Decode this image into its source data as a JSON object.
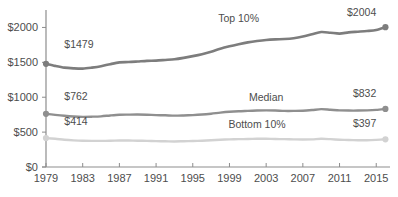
{
  "chart_data": {
    "type": "line",
    "title": "",
    "subtitle": "",
    "xlabel": "",
    "ylabel": "",
    "xlim": [
      1979,
      2016.5
    ],
    "ylim": [
      0,
      2250
    ],
    "grid": false,
    "legend_position": "inline-labels",
    "y_ticks": [
      {
        "value": 0,
        "label": "$0"
      },
      {
        "value": 500,
        "label": "$500"
      },
      {
        "value": 1000,
        "label": "$1000"
      },
      {
        "value": 1500,
        "label": "$1500"
      },
      {
        "value": 2000,
        "label": "$2000"
      }
    ],
    "x_ticks": [
      {
        "value": 1979,
        "label": "1979"
      },
      {
        "value": 1983,
        "label": "1983"
      },
      {
        "value": 1987,
        "label": "1987"
      },
      {
        "value": 1991,
        "label": "1991"
      },
      {
        "value": 1995,
        "label": "1995"
      },
      {
        "value": 1999,
        "label": "1999"
      },
      {
        "value": 2003,
        "label": "2003"
      },
      {
        "value": 2007,
        "label": "2007"
      },
      {
        "value": 2011,
        "label": "2011"
      },
      {
        "value": 2015,
        "label": "2015"
      }
    ],
    "series": [
      {
        "name": "Top 10%",
        "label": "Top 10%",
        "color": "#7d7d7d",
        "start_value_label": "$1479",
        "end_value_label": "$2004",
        "start_value": 1479,
        "end_value": 2004,
        "x": [
          1979,
          1980,
          1981,
          1982,
          1983,
          1984,
          1985,
          1986,
          1987,
          1988,
          1989,
          1990,
          1991,
          1992,
          1993,
          1994,
          1995,
          1996,
          1997,
          1998,
          1999,
          2000,
          2001,
          2002,
          2003,
          2004,
          2005,
          2006,
          2007,
          2008,
          2009,
          2010,
          2011,
          2012,
          2013,
          2014,
          2015,
          2016
        ],
        "values": [
          1479,
          1449,
          1424,
          1414,
          1410,
          1424,
          1444,
          1474,
          1499,
          1504,
          1512,
          1521,
          1524,
          1534,
          1544,
          1564,
          1589,
          1617,
          1652,
          1694,
          1729,
          1759,
          1786,
          1806,
          1821,
          1829,
          1834,
          1846,
          1869,
          1902,
          1934,
          1924,
          1912,
          1929,
          1939,
          1949,
          1964,
          2004
        ]
      },
      {
        "name": "Median",
        "label": "Median",
        "color": "#8f8f8f",
        "start_value_label": "$762",
        "end_value_label": "$832",
        "start_value": 762,
        "end_value": 832,
        "x": [
          1979,
          1980,
          1981,
          1982,
          1983,
          1984,
          1985,
          1986,
          1987,
          1988,
          1989,
          1990,
          1991,
          1992,
          1993,
          1994,
          1995,
          1996,
          1997,
          1998,
          1999,
          2000,
          2001,
          2002,
          2003,
          2004,
          2005,
          2006,
          2007,
          2008,
          2009,
          2010,
          2011,
          2012,
          2013,
          2014,
          2015,
          2016
        ],
        "values": [
          762,
          747,
          734,
          724,
          719,
          721,
          726,
          739,
          749,
          751,
          752,
          749,
          744,
          741,
          736,
          739,
          744,
          752,
          764,
          779,
          791,
          799,
          804,
          809,
          811,
          809,
          804,
          804,
          806,
          816,
          829,
          821,
          812,
          809,
          809,
          812,
          819,
          832
        ]
      },
      {
        "name": "Bottom 10%",
        "label": "Bottom 10%",
        "color": "#d2d2d2",
        "start_value_label": "$414",
        "end_value_label": "$397",
        "start_value": 414,
        "end_value": 397,
        "x": [
          1979,
          1980,
          1981,
          1982,
          1983,
          1984,
          1985,
          1986,
          1987,
          1988,
          1989,
          1990,
          1991,
          1992,
          1993,
          1994,
          1995,
          1996,
          1997,
          1998,
          1999,
          2000,
          2001,
          2002,
          2003,
          2004,
          2005,
          2006,
          2007,
          2008,
          2009,
          2010,
          2011,
          2012,
          2013,
          2014,
          2015,
          2016
        ],
        "values": [
          414,
          404,
          391,
          382,
          376,
          374,
          374,
          376,
          379,
          379,
          377,
          374,
          371,
          369,
          366,
          369,
          372,
          377,
          384,
          391,
          396,
          399,
          401,
          404,
          404,
          401,
          399,
          396,
          394,
          396,
          404,
          399,
          391,
          386,
          384,
          384,
          389,
          397
        ]
      }
    ],
    "annotations": [
      {
        "name": "top-series-inline-label",
        "text": "Top 10%",
        "x": 2000,
        "y": 2080
      },
      {
        "name": "median-series-inline-label",
        "text": "Median",
        "x": 2003,
        "y": 950
      },
      {
        "name": "bottom-series-inline-label",
        "text": "Bottom 10%",
        "x": 2002,
        "y": 560
      },
      {
        "name": "top-start-value",
        "text": "$1479",
        "x": 1981,
        "y": 1700
      },
      {
        "name": "top-end-value",
        "text": "$2004",
        "x": 2015,
        "y": 2170
      },
      {
        "name": "median-start-value",
        "text": "$762",
        "x": 1981,
        "y": 960
      },
      {
        "name": "median-end-value",
        "text": "$832",
        "x": 2015,
        "y": 1000
      },
      {
        "name": "bottom-start-value",
        "text": "$414",
        "x": 1981,
        "y": 600
      },
      {
        "name": "bottom-end-value",
        "text": "$397",
        "x": 2015,
        "y": 570
      }
    ]
  }
}
